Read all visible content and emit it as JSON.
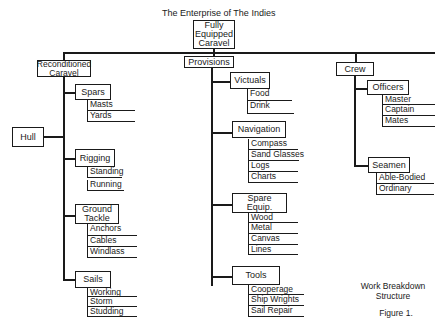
{
  "title": "The Enterprise of The Indies",
  "root": {
    "label": "Fully\nEquipped\nCaravel"
  },
  "branches": {
    "reconditioned": {
      "label": "Reconditioned\nCaravel",
      "hull": "Hull",
      "spars": {
        "label": "Spars",
        "items": [
          "Masts",
          "Yards"
        ]
      },
      "rigging": {
        "label": "Rigging",
        "items": [
          "Standing",
          "Running"
        ]
      },
      "ground_tackle": {
        "label": "Ground\nTackle",
        "items": [
          "Anchors",
          "Cables",
          "Windlass"
        ]
      },
      "sails": {
        "label": "Sails",
        "items": [
          "Working",
          "Storm",
          "Studding"
        ]
      }
    },
    "provisions": {
      "label": "Provisions",
      "victuals": {
        "label": "Victuals",
        "items": [
          "Food",
          "Drink"
        ]
      },
      "navigation": {
        "label": "Navigation",
        "items": [
          "Compass",
          "Sand Glasses",
          "Logs",
          "Charts"
        ]
      },
      "spare_equip": {
        "label": "Spare\nEquip.",
        "items": [
          "Wood",
          "Metal",
          "Canvas",
          "Lines"
        ]
      },
      "tools": {
        "label": "Tools",
        "items": [
          "Cooperage",
          "Ship Wrights",
          "Sail Repair"
        ]
      }
    },
    "crew": {
      "label": "Crew",
      "officers": {
        "label": "Officers",
        "items": [
          "Master",
          "Captain",
          "Mates"
        ]
      },
      "seamen": {
        "label": "Seamen",
        "items": [
          "Able-Bodied",
          "Ordinary"
        ]
      }
    }
  },
  "caption": {
    "subtitle": "Work Breakdown\nStructure",
    "figure": "Figure 1."
  }
}
